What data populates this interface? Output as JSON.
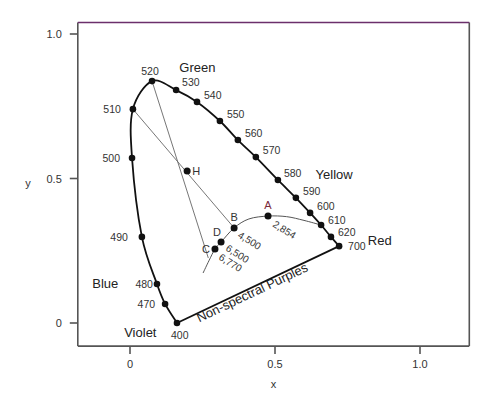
{
  "chart_data": {
    "type": "scatter",
    "xlabel": "x",
    "ylabel": "y",
    "xlim": [
      -0.18,
      1.17
    ],
    "ylim": [
      -0.08,
      1.04
    ],
    "grid": false,
    "x_ticks": [
      {
        "value": 0,
        "label": "0"
      },
      {
        "value": 0.5,
        "label": "0.5"
      },
      {
        "value": 1.0,
        "label": "1.0"
      }
    ],
    "y_ticks": [
      {
        "value": 0,
        "label": "0"
      },
      {
        "value": 0.5,
        "label": "0.5"
      },
      {
        "value": 1.0,
        "label": "1.0"
      }
    ],
    "spectral_locus": [
      {
        "nm": "400",
        "x": 0.162,
        "y": 0.0,
        "label": "400",
        "labeled_dot": true
      },
      {
        "nm": "470",
        "x": 0.121,
        "y": 0.066,
        "label": "470",
        "labeled_dot": true
      },
      {
        "nm": "480",
        "x": 0.093,
        "y": 0.135,
        "label": "480",
        "labeled_dot": true
      },
      {
        "nm": "490",
        "x": 0.041,
        "y": 0.298,
        "label": "490",
        "labeled_dot": true
      },
      {
        "nm": "500",
        "x": 0.007,
        "y": 0.571,
        "label": "500",
        "labeled_dot": true
      },
      {
        "nm": "510",
        "x": 0.01,
        "y": 0.74,
        "label": "510",
        "labeled_dot": true
      },
      {
        "nm": "520",
        "x": 0.076,
        "y": 0.837,
        "label": "520",
        "labeled_dot": true
      },
      {
        "nm": "530",
        "x": 0.159,
        "y": 0.806,
        "label": "530",
        "labeled_dot": true
      },
      {
        "nm": "540",
        "x": 0.231,
        "y": 0.765,
        "label": "540",
        "labeled_dot": true
      },
      {
        "nm": "550",
        "x": 0.31,
        "y": 0.699,
        "label": "550",
        "labeled_dot": true
      },
      {
        "nm": "560",
        "x": 0.372,
        "y": 0.633,
        "label": "560",
        "labeled_dot": true
      },
      {
        "nm": "570",
        "x": 0.434,
        "y": 0.574,
        "label": "570",
        "labeled_dot": true
      },
      {
        "nm": "580",
        "x": 0.51,
        "y": 0.495,
        "label": "580",
        "labeled_dot": true
      },
      {
        "nm": "590",
        "x": 0.572,
        "y": 0.433,
        "label": "590",
        "labeled_dot": true
      },
      {
        "nm": "600",
        "x": 0.621,
        "y": 0.381,
        "label": "600",
        "labeled_dot": true
      },
      {
        "nm": "610",
        "x": 0.659,
        "y": 0.339,
        "label": "610",
        "labeled_dot": true
      },
      {
        "nm": "620",
        "x": 0.693,
        "y": 0.298,
        "label": "620",
        "labeled_dot": true
      },
      {
        "nm": "700",
        "x": 0.721,
        "y": 0.266,
        "label": "700",
        "labeled_dot": true
      }
    ],
    "non_spectral_purples": {
      "from": "400",
      "to": "700",
      "label": "Non-spectral Purples"
    },
    "region_labels": [
      {
        "text": "Green",
        "x": 0.17,
        "y": 0.87
      },
      {
        "text": "Yellow",
        "x": 0.64,
        "y": 0.5
      },
      {
        "text": "Red",
        "x": 0.82,
        "y": 0.27
      },
      {
        "text": "Blue",
        "x": -0.13,
        "y": 0.12
      },
      {
        "text": "Violet",
        "x": -0.02,
        "y": -0.05
      }
    ],
    "named_points": [
      {
        "id": "H",
        "label": "H",
        "x": 0.197,
        "y": 0.526,
        "temp": ""
      },
      {
        "id": "A",
        "label": "A",
        "x": 0.476,
        "y": 0.37,
        "temp": "2,854",
        "color": "#7a2a3a"
      },
      {
        "id": "B",
        "label": "B",
        "x": 0.359,
        "y": 0.329,
        "temp": "4,500"
      },
      {
        "id": "D",
        "label": "D",
        "x": 0.314,
        "y": 0.28,
        "temp": "6,500"
      },
      {
        "id": "C",
        "label": "C",
        "x": 0.293,
        "y": 0.256,
        "temp": "6,770"
      }
    ],
    "planckian_locus": [
      [
        0.252,
        0.173
      ],
      [
        0.272,
        0.215
      ],
      [
        0.293,
        0.256
      ],
      [
        0.314,
        0.28
      ],
      [
        0.359,
        0.329
      ],
      [
        0.41,
        0.36
      ],
      [
        0.476,
        0.37
      ],
      [
        0.54,
        0.368
      ],
      [
        0.6,
        0.355
      ],
      [
        0.659,
        0.339
      ]
    ],
    "construction_lines": [
      {
        "from": "520",
        "through": "H",
        "to": [
          0.27,
          0.225
        ]
      },
      {
        "from": "510",
        "through": "H",
        "to": "B"
      }
    ]
  }
}
